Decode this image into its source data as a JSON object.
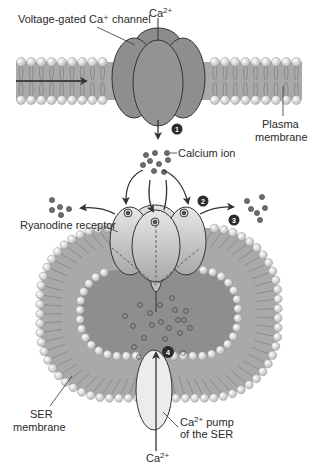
{
  "labels": {
    "voltage_channel": "Voltage-gated Ca⁺ channel",
    "ca_top": "Ca",
    "ca_top_sup": "2+",
    "plasma_line1": "Plasma",
    "plasma_line2": "membrane",
    "calcium_ion": "Calcium ion",
    "ryanodine": "Ryanodine receptor",
    "ser_line1": "SER",
    "ser_line2": "membrane",
    "pump_line1_pre": "Ca",
    "pump_line1_sup": "2+",
    "pump_line1_post": " pump",
    "pump_line2": "of the SER",
    "ca_bottom": "Ca",
    "ca_bottom_sup": "2+"
  },
  "steps": [
    "1",
    "2",
    "3",
    "4"
  ],
  "colors": {
    "membrane_fill": "#a9a9a9",
    "head_fill": "#e4e4e4",
    "channel_fill": "#8c8c8c",
    "receptor_fill": "#cfcfcf",
    "lumen_fill": "#8e8e8e",
    "pump_fill": "#ececec",
    "ion_fill": "#6e6e6e",
    "badge_fill": "#2b2b2b",
    "line": "#333333"
  }
}
